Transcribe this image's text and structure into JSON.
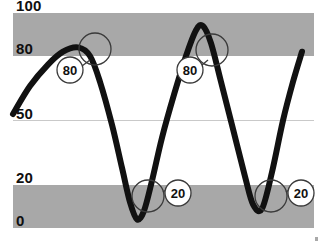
{
  "chart_data": {
    "type": "line",
    "title": "",
    "subtitle": "",
    "xlabel": "",
    "ylabel": "",
    "xlim": [
      0,
      324
    ],
    "ylim": [
      0,
      100
    ],
    "grid": true,
    "legend_position": "none",
    "y_ticks": [
      {
        "value": 100,
        "label": "100"
      },
      {
        "value": 80,
        "label": "80"
      },
      {
        "value": 50,
        "label": "50"
      },
      {
        "value": 20,
        "label": "20"
      },
      {
        "value": 0,
        "label": "0"
      }
    ],
    "x_ticks": [],
    "bands": [
      {
        "name": "upper-threshold-band",
        "from": 80,
        "to": 100,
        "color": "#a8a8a8"
      },
      {
        "name": "lower-threshold-band",
        "from": 0,
        "to": 20,
        "color": "#a8a8a8"
      }
    ],
    "gridlines": [
      {
        "value": 50,
        "color": "#c9c9c9"
      }
    ],
    "series": [
      {
        "name": "signal",
        "color": "#111111",
        "line_width": 6,
        "points": [
          {
            "x": 13,
            "y": 53
          },
          {
            "x": 30,
            "y": 66
          },
          {
            "x": 48,
            "y": 76
          },
          {
            "x": 63,
            "y": 82
          },
          {
            "x": 78,
            "y": 84
          },
          {
            "x": 90,
            "y": 80
          },
          {
            "x": 100,
            "y": 68
          },
          {
            "x": 112,
            "y": 48
          },
          {
            "x": 122,
            "y": 28
          },
          {
            "x": 130,
            "y": 12
          },
          {
            "x": 137,
            "y": 4
          },
          {
            "x": 144,
            "y": 8
          },
          {
            "x": 152,
            "y": 22
          },
          {
            "x": 162,
            "y": 42
          },
          {
            "x": 174,
            "y": 62
          },
          {
            "x": 186,
            "y": 80
          },
          {
            "x": 196,
            "y": 92
          },
          {
            "x": 203,
            "y": 94
          },
          {
            "x": 211,
            "y": 86
          },
          {
            "x": 221,
            "y": 68
          },
          {
            "x": 233,
            "y": 46
          },
          {
            "x": 245,
            "y": 24
          },
          {
            "x": 253,
            "y": 11
          },
          {
            "x": 262,
            "y": 9
          },
          {
            "x": 272,
            "y": 26
          },
          {
            "x": 283,
            "y": 50
          },
          {
            "x": 293,
            "y": 68
          },
          {
            "x": 302,
            "y": 82
          }
        ]
      }
    ],
    "annotations": [
      {
        "id": "callout-80-descending",
        "label": "80",
        "threshold": 80,
        "marker_circle": {
          "cx": 95,
          "cy": 49,
          "r": 16
        },
        "bubble": {
          "cx": 70,
          "cy": 70,
          "r": 13
        },
        "leader": {
          "x1": 82,
          "y1": 66,
          "x2": 90,
          "y2": 60
        }
      },
      {
        "id": "callout-80-ascending",
        "label": "80",
        "threshold": 80,
        "marker_circle": {
          "cx": 212,
          "cy": 50,
          "r": 16
        },
        "bubble": {
          "cx": 190,
          "cy": 70,
          "r": 13
        },
        "leader": {
          "x1": 202,
          "y1": 65,
          "x2": 208,
          "y2": 60
        }
      },
      {
        "id": "callout-20-first",
        "label": "20",
        "threshold": 20,
        "marker_circle": {
          "cx": 148,
          "cy": 196,
          "r": 16
        },
        "bubble": {
          "cx": 178,
          "cy": 193,
          "r": 13
        },
        "leader": {
          "x1": 163,
          "y1": 192,
          "x2": 166,
          "y2": 190
        }
      },
      {
        "id": "callout-20-second",
        "label": "20",
        "threshold": 20,
        "marker_circle": {
          "cx": 271,
          "cy": 196,
          "r": 16
        },
        "bubble": {
          "cx": 301,
          "cy": 193,
          "r": 13
        },
        "leader": {
          "x1": 286,
          "y1": 192,
          "x2": 289,
          "y2": 190
        }
      }
    ],
    "colors": {
      "band": "#a8a8a8",
      "background": "#ffffff",
      "line": "#111111",
      "gridline": "#c9c9c9",
      "label": "#0f0f0f",
      "annotation_stroke": "#3a3a3a"
    }
  }
}
